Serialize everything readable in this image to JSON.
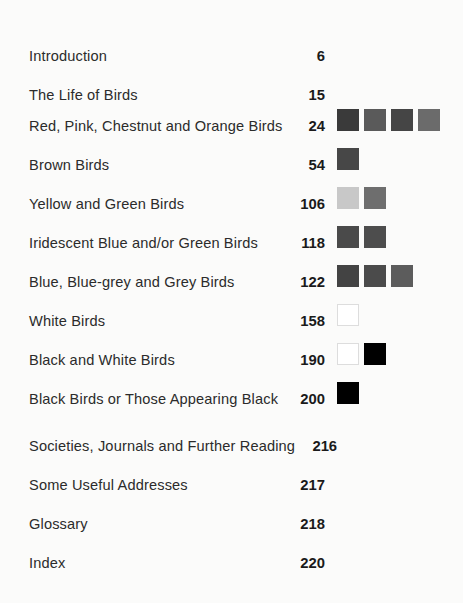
{
  "document": {
    "type": "book-table-of-contents",
    "background_color": "#fbfbfa",
    "text_color": "#2b2b2b",
    "page_number_color": "#1a1a1a"
  },
  "entries": [
    {
      "title": "Introduction",
      "page": "6",
      "swatches": []
    },
    {
      "title": "The Life of Birds",
      "page": "15",
      "swatches": []
    },
    {
      "title": "Red, Pink, Chestnut and Orange Birds",
      "page": "24",
      "swatches": [
        "#3a3a3a",
        "#5a5a5a",
        "#454545",
        "#6b6b6b"
      ]
    },
    {
      "title": "Brown Birds",
      "page": "54",
      "swatches": [
        "#474747"
      ]
    },
    {
      "title": "Yellow and Green Birds",
      "page": "106",
      "swatches": [
        "#c8c8c8",
        "#6e6e6e"
      ]
    },
    {
      "title": "Iridescent Blue and/or Green Birds",
      "page": "118",
      "swatches": [
        "#4a4a4a",
        "#4d4d4d"
      ]
    },
    {
      "title": "Blue, Blue-grey and Grey Birds",
      "page": "122",
      "swatches": [
        "#434343",
        "#4b4b4b",
        "#5c5c5c"
      ]
    },
    {
      "title": "White Birds",
      "page": "158",
      "swatches": [
        "#ffffff"
      ]
    },
    {
      "title": "Black and White Birds",
      "page": "190",
      "swatches": [
        "#ffffff",
        "#000000"
      ]
    },
    {
      "title": "Black Birds or Those Appearing Black",
      "page": "200",
      "swatches": [
        "#000000"
      ]
    },
    {
      "title": "Societies, Journals and Further Reading",
      "page": "216",
      "swatches": []
    },
    {
      "title": "Some Useful Addresses",
      "page": "217",
      "swatches": []
    },
    {
      "title": "Glossary",
      "page": "218",
      "swatches": []
    },
    {
      "title": "Index",
      "page": "220",
      "swatches": []
    }
  ]
}
